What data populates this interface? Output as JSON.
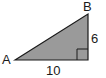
{
  "diagram": {
    "type": "right-triangle",
    "fill_color": "#9a9a9a",
    "stroke_color": "#1a1a1a",
    "vertices": {
      "A": {
        "label": "A",
        "x": 15,
        "y": 60
      },
      "B": {
        "label": "B",
        "x": 88,
        "y": 14
      },
      "C": {
        "label": "",
        "x": 88,
        "y": 60
      }
    },
    "right_angle_at": "C",
    "sides": {
      "base": {
        "label": "10"
      },
      "height": {
        "label": "6"
      }
    }
  }
}
